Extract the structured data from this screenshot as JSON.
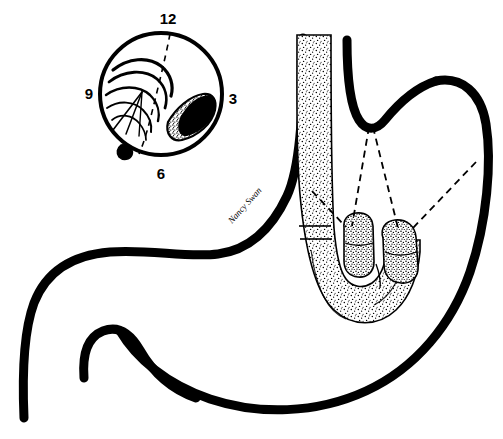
{
  "figure": {
    "background_color": "#ffffff",
    "ink_color": "#000000",
    "width": 503,
    "height": 439
  },
  "inset": {
    "name": "endoscopic-clock-face-view",
    "shape": "circle",
    "center_x": 161,
    "center_y": 94,
    "radius": 61,
    "clock_labels": [
      {
        "label": "12",
        "position": "top",
        "x": 168,
        "y": 24
      },
      {
        "label": "3",
        "position": "right",
        "x": 233,
        "y": 104
      },
      {
        "label": "6",
        "position": "bottom",
        "x": 161,
        "y": 179
      },
      {
        "label": "9",
        "position": "left",
        "x": 89,
        "y": 99
      }
    ],
    "features": [
      {
        "name": "gastric-folds",
        "description": "radiating mucosal folds",
        "side": "left"
      },
      {
        "name": "lesion",
        "description": "stippled shaded lesion",
        "side": "right"
      },
      {
        "name": "scope-shaft-nub",
        "description": "retroflexed scope shaft at rim",
        "position": "7 o'clock"
      },
      {
        "name": "midline-dashed-curve",
        "description": "dashed vertical reference line"
      }
    ]
  },
  "stomach": {
    "name": "stomach-outline",
    "stroke_width": 9,
    "parts": [
      "lesser-curvature",
      "greater-curvature",
      "fundus",
      "cardiac-notch",
      "antrum",
      "pylorus",
      "duodenal-bulb"
    ]
  },
  "endoscope": {
    "name": "retroflexed-endoscope",
    "description": "stippled flexible endoscope entering through the esophagus and retroflexed in a J-turn",
    "shaft_band_y": 231,
    "tips": [
      {
        "name": "endoscope-tip-left",
        "x": 356,
        "y": 238
      },
      {
        "name": "endoscope-tip-right",
        "x": 402,
        "y": 242
      }
    ]
  },
  "projection_lines": {
    "name": "dashed-projection-lines",
    "style": "dashed",
    "dash_pattern": "7 5",
    "stroke_width": 1.7,
    "lines": [
      {
        "name": "cardia-to-left-tip",
        "x1": 369,
        "y1": 127,
        "x2": 352,
        "y2": 228
      },
      {
        "name": "cardia-to-right-tip",
        "x1": 372,
        "y1": 127,
        "x2": 398,
        "y2": 230
      },
      {
        "name": "shaft-to-left-tip",
        "x1": 313,
        "y1": 192,
        "x2": 347,
        "y2": 228
      },
      {
        "name": "right-wall-to-tip",
        "x1": 474,
        "y1": 163,
        "x2": 410,
        "y2": 229
      }
    ]
  },
  "signature": {
    "name": "artist-signature",
    "text": "Nancy Swan",
    "x": 232,
    "y": 224,
    "rotation": -48
  }
}
